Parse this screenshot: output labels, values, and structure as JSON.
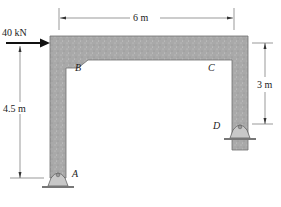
{
  "diagram": {
    "type": "structural-frame",
    "load": {
      "value": "40 kN",
      "direction": "right",
      "applied_at": "B"
    },
    "joints": {
      "A": "A",
      "B": "B",
      "C": "C",
      "D": "D"
    },
    "dimensions": {
      "span": "6 m",
      "height_left": "4.5 m",
      "height_right": "3 m"
    },
    "supports": [
      {
        "joint": "A",
        "type": "pin"
      },
      {
        "joint": "D",
        "type": "pin"
      }
    ],
    "colors": {
      "member_fill": "#a8a8a8",
      "member_edge": "#6e6e6e",
      "support_fill": "#c8c8c8",
      "dimension_line": "#333333",
      "load_arrow": "#111111"
    }
  }
}
